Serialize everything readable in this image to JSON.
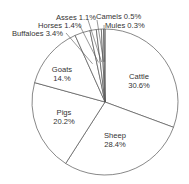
{
  "chart_data": {
    "type": "pie",
    "title": "",
    "start_angle_deg": 0,
    "direction": "clockwise",
    "fill_color": "#ffffff",
    "stroke_color": "#555555",
    "text_color": "#333333",
    "slices": [
      {
        "name": "Cattle",
        "value": 30.6,
        "label": "Cattle",
        "pct": "30.6%",
        "inside": true
      },
      {
        "name": "Sheep",
        "value": 28.4,
        "label": "Sheep",
        "pct": "28.4%",
        "inside": true
      },
      {
        "name": "Pigs",
        "value": 20.2,
        "label": "Pigs",
        "pct": "20.2%",
        "inside": true
      },
      {
        "name": "Goats",
        "value": 14.0,
        "label": "Goats",
        "pct": "14.%",
        "inside": true
      },
      {
        "name": "Buffaloes",
        "value": 3.4,
        "label": "Buffaloes 3.4%",
        "inside": false
      },
      {
        "name": "Horses",
        "value": 1.4,
        "label": "Horses 1.4%",
        "inside": false
      },
      {
        "name": "Asses",
        "value": 1.1,
        "label": "Asses 1.1%",
        "inside": false
      },
      {
        "name": "Camels",
        "value": 0.5,
        "label": "Camels 0.5%",
        "inside": false
      },
      {
        "name": "Mules",
        "value": 0.3,
        "label": "Mules 0.3%",
        "inside": false
      }
    ],
    "categories": [
      "Cattle",
      "Sheep",
      "Pigs",
      "Goats",
      "Buffaloes",
      "Horses",
      "Asses",
      "Camels",
      "Mules"
    ],
    "values": [
      30.6,
      28.4,
      20.2,
      14.0,
      3.4,
      1.4,
      1.1,
      0.5,
      0.3
    ],
    "legend": "none (labels on/around slices)"
  },
  "labels": {
    "cattle": {
      "name": "Cattle",
      "pct": "30.6%"
    },
    "sheep": {
      "name": "Sheep",
      "pct": "28.4%"
    },
    "pigs": {
      "name": "Pigs",
      "pct": "20.2%"
    },
    "goats": {
      "name": "Goats",
      "pct": "14.%"
    },
    "buffaloes": "Buffaloes 3.4%",
    "horses": "Horses 1.4%",
    "asses": "Asses 1.1%",
    "camels": "Camels 0.5%",
    "mules": "Mules 0.3%"
  }
}
